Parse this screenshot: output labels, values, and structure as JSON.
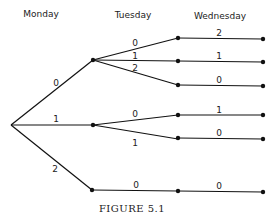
{
  "headers": [
    "Monday",
    "Tuesday",
    "Wednesday"
  ],
  "caption": "Figure 5.1",
  "caption_display": "FIGURE 5.1",
  "tree": {
    "root": "start",
    "branches": [
      {
        "label": "0",
        "children": [
          {
            "label": "0",
            "children": [
              {
                "label": "2"
              }
            ]
          },
          {
            "label": "1",
            "children": [
              {
                "label": "1"
              }
            ]
          },
          {
            "label": "2",
            "children": [
              {
                "label": "0"
              }
            ]
          }
        ]
      },
      {
        "label": "1",
        "children": [
          {
            "label": "0",
            "children": [
              {
                "label": "1"
              }
            ]
          },
          {
            "label": "1",
            "children": [
              {
                "label": "0"
              }
            ]
          }
        ]
      },
      {
        "label": "2",
        "children": [
          {
            "label": "0",
            "children": [
              {
                "label": "0"
              }
            ]
          }
        ]
      }
    ]
  },
  "labels": {
    "mon_0": "0",
    "mon_1": "1",
    "mon_2": "2",
    "tue_a0": "0",
    "tue_a1": "1",
    "tue_a2": "2",
    "tue_b0": "0",
    "tue_b1": "1",
    "tue_c0": "0",
    "wed_a0": "2",
    "wed_a1": "1",
    "wed_a2": "0",
    "wed_b0": "1",
    "wed_b1": "0",
    "wed_c0": "0"
  }
}
